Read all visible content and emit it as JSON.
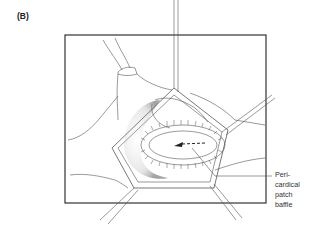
{
  "figure": {
    "panel_label": "(B)",
    "annotations": [
      {
        "lines": [
          "Peri-",
          "cardical",
          "patch",
          "baffle"
        ]
      }
    ]
  },
  "colors": {
    "line": "#555555",
    "frame": "#333333",
    "shadow": "#666666"
  }
}
